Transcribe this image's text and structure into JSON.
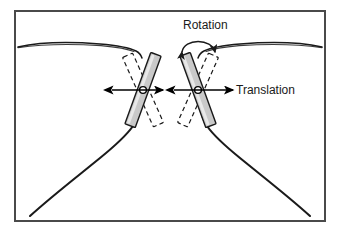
{
  "figure": {
    "background_color": "#ffffff",
    "border": {
      "name": "figure-border",
      "color": "#4a4a4a",
      "x": 14,
      "y": 10,
      "width": 312,
      "height": 212,
      "stroke_width": 2
    },
    "labels": {
      "rotation": "Rotation",
      "translation": "Translation"
    },
    "colors": {
      "instrument_fill": "#c9c9c9",
      "instrument_stroke": "#1a1a1a",
      "dashed_stroke": "#1a1a1a",
      "tissue_stroke": "#1a1a1a",
      "arrow_color": "#000000",
      "pivot_fill": "#ffffff",
      "pivot_stroke": "#000000",
      "text_color": "#1a1a1a"
    },
    "elements": [
      {
        "name": "tissue-curve-top-left",
        "description": "upper left tissue surface curve"
      },
      {
        "name": "tissue-curve-top-right",
        "description": "upper right tissue surface curve"
      },
      {
        "name": "tissue-curve-bottom-left",
        "description": "lower left tissue wall curve"
      },
      {
        "name": "tissue-curve-bottom-right",
        "description": "lower right tissue wall curve"
      },
      {
        "name": "instrument-left-solid",
        "description": "left instrument shaft, solid gray bar"
      },
      {
        "name": "instrument-left-dashed",
        "description": "left instrument shaft, dashed rotated position"
      },
      {
        "name": "instrument-right-solid",
        "description": "right instrument shaft, solid gray bar"
      },
      {
        "name": "instrument-right-dashed",
        "description": "right instrument shaft, dashed rotated position"
      },
      {
        "name": "pivot-point-left",
        "description": "left incision pivot point circle"
      },
      {
        "name": "pivot-point-right",
        "description": "right incision pivot point circle"
      },
      {
        "name": "translation-arrow-left",
        "description": "left horizontal double-headed translation arrow"
      },
      {
        "name": "translation-arrow-right",
        "description": "right horizontal double-headed translation arrow"
      },
      {
        "name": "rotation-arc-arrow",
        "description": "curved double-headed rotation arrow above right instrument"
      }
    ]
  }
}
